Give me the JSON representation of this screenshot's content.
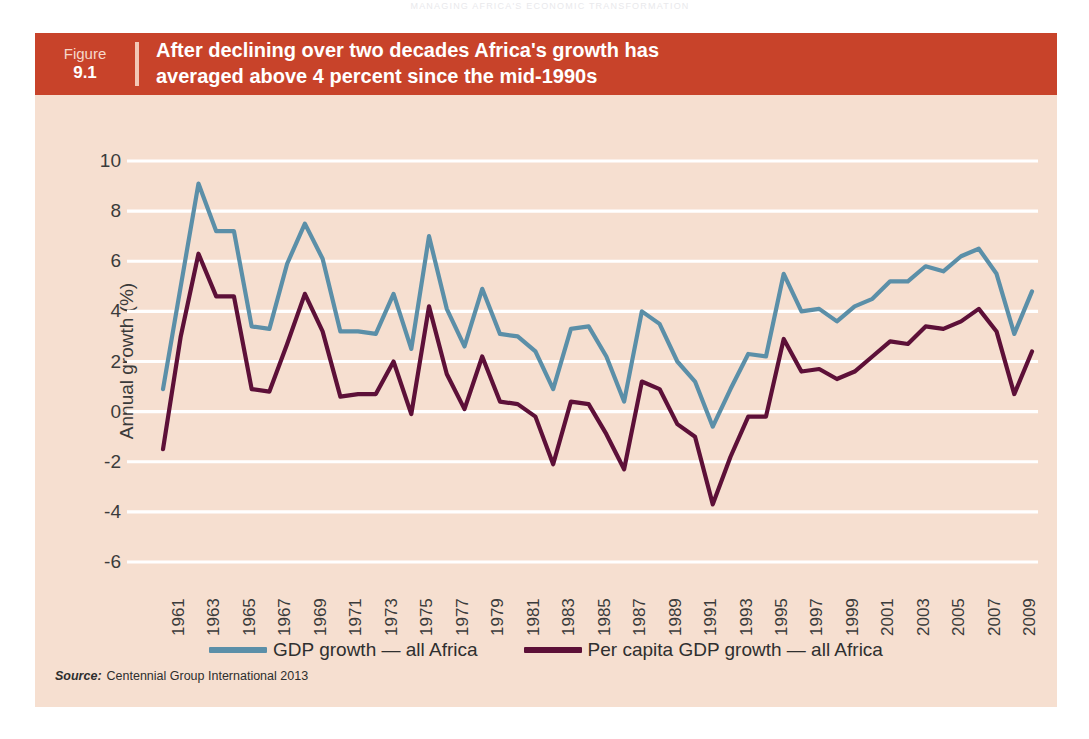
{
  "page": {
    "running_head": "MANAGING AFRICA'S ECONOMIC TRANSFORMATION"
  },
  "figure": {
    "label_word": "Figure",
    "number": "9.1",
    "title_line1": "After declining over two decades Africa's growth has",
    "title_line2": "averaged above 4 percent since the mid-1990s",
    "banner_color": "#c8432a",
    "panel_color": "#f6dfd0"
  },
  "source": {
    "label": "Source:",
    "text": "Centennial Group International 2013"
  },
  "legend": [
    {
      "name": "GDP growth — all Africa",
      "color": "#5b8fa8"
    },
    {
      "name": "Per capita GDP growth — all Africa",
      "color": "#5d1038"
    }
  ],
  "chart_data": {
    "type": "line",
    "title": "After declining over two decades Africa's growth has averaged above 4 percent since the mid-1990s",
    "xlabel": "",
    "ylabel": "Annual growth (%)",
    "ylim": [
      -6,
      10
    ],
    "ytick_step": 2,
    "yticks": [
      10,
      8,
      6,
      4,
      2,
      0,
      -2,
      -4,
      -6
    ],
    "xlim": [
      1961,
      2010
    ],
    "xticks": [
      1961,
      1963,
      1965,
      1967,
      1969,
      1971,
      1973,
      1975,
      1977,
      1979,
      1981,
      1983,
      1985,
      1987,
      1989,
      1991,
      1993,
      1995,
      1997,
      1999,
      2001,
      2003,
      2005,
      2007,
      2009
    ],
    "grid": "horizontal-white",
    "legend_position": "bottom-center",
    "x": [
      1961,
      1962,
      1963,
      1964,
      1965,
      1966,
      1967,
      1968,
      1969,
      1970,
      1971,
      1972,
      1973,
      1974,
      1975,
      1976,
      1977,
      1978,
      1979,
      1980,
      1981,
      1982,
      1983,
      1984,
      1985,
      1986,
      1987,
      1988,
      1989,
      1990,
      1991,
      1992,
      1993,
      1994,
      1995,
      1996,
      1997,
      1998,
      1999,
      2000,
      2001,
      2002,
      2003,
      2004,
      2005,
      2006,
      2007,
      2008,
      2009,
      2010
    ],
    "series": [
      {
        "name": "GDP growth — all Africa",
        "color": "#5b8fa8",
        "values": [
          0.9,
          5.0,
          9.1,
          7.2,
          7.2,
          3.4,
          3.3,
          5.9,
          7.5,
          6.1,
          3.2,
          3.2,
          3.1,
          4.7,
          2.5,
          7.0,
          4.1,
          2.6,
          4.9,
          3.1,
          3.0,
          2.4,
          0.9,
          3.3,
          3.4,
          2.2,
          0.4,
          4.0,
          3.5,
          2.0,
          1.2,
          -0.6,
          0.9,
          2.3,
          2.2,
          5.5,
          4.0,
          4.1,
          3.6,
          4.2,
          4.5,
          5.2,
          5.2,
          5.8,
          5.6,
          6.2,
          6.5,
          5.5,
          3.1,
          4.8
        ]
      },
      {
        "name": "Per capita GDP growth — all Africa",
        "color": "#5d1038",
        "values": [
          -1.5,
          3.0,
          6.3,
          4.6,
          4.6,
          0.9,
          0.8,
          2.7,
          4.7,
          3.2,
          0.6,
          0.7,
          0.7,
          2.0,
          -0.1,
          4.2,
          1.5,
          0.1,
          2.2,
          0.4,
          0.3,
          -0.2,
          -2.1,
          0.4,
          0.3,
          -0.9,
          -2.3,
          1.2,
          0.9,
          -0.5,
          -1.0,
          -3.7,
          -1.8,
          -0.2,
          -0.2,
          2.9,
          1.6,
          1.7,
          1.3,
          1.6,
          2.2,
          2.8,
          2.7,
          3.4,
          3.3,
          3.6,
          4.1,
          3.2,
          0.7,
          2.4
        ]
      }
    ]
  }
}
